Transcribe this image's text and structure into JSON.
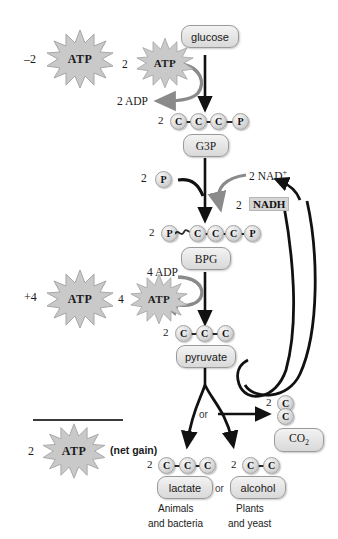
{
  "figure": {
    "type": "glycolysis-pathway-diagram",
    "top_partial_caption": "",
    "bottom_partial_caption": ""
  },
  "ledger": {
    "invest_value": "–2",
    "invest_atp": "ATP",
    "payoff_value": "+4",
    "payoff_atp": "ATP",
    "net_value": "2",
    "net_atp": "ATP",
    "net_note": "(net gain)"
  },
  "pathway": {
    "glucose": {
      "label": "glucose",
      "atp_count": "2",
      "atp_label": "ATP",
      "adp_label": "2 ADP"
    },
    "g3p": {
      "label": "G3P",
      "prefix": "2",
      "beads": [
        "C",
        "C",
        "C",
        "P"
      ]
    },
    "oxidation": {
      "phosphate_prefix": "2",
      "phosphate_bead": "P",
      "nad_label": "2 NAD",
      "nad_superscript": "+",
      "nadh_prefix": "2",
      "nadh_label": "NADH"
    },
    "bpg": {
      "label": "BPG",
      "prefix": "2",
      "lead_bead": "P",
      "beads": [
        "C",
        "C",
        "C",
        "P"
      ],
      "adp_label": "4 ADP",
      "atp_count": "4",
      "atp_label": "ATP"
    },
    "pyruvate": {
      "label": "pyruvate",
      "prefix": "2",
      "beads": [
        "C",
        "C",
        "C"
      ]
    },
    "fork": {
      "or_label": "or"
    },
    "lactate": {
      "label": "lactate",
      "prefix": "2",
      "beads": [
        "C",
        "C",
        "C"
      ],
      "organisms_line1": "Animals",
      "organisms_line2": "and bacteria"
    },
    "alcohol": {
      "label": "alcohol",
      "prefix": "2",
      "beads": [
        "C",
        "C"
      ],
      "or_label": "or",
      "organisms_line1": "Plants",
      "organisms_line2": "and yeast"
    },
    "co2": {
      "label": "CO",
      "subscript": "2",
      "prefix": "2",
      "bead_top": "C",
      "bead_bottom": "C"
    }
  },
  "colors": {
    "arrow": "#111111",
    "gray_arrow": "#8a8a8a",
    "box_fill": "#e4e4e4",
    "box_border": "#9a9a9a",
    "bead_fill": "#dcdcdc",
    "highlight": "#d6d6d6",
    "text": "#1a1a1a"
  }
}
